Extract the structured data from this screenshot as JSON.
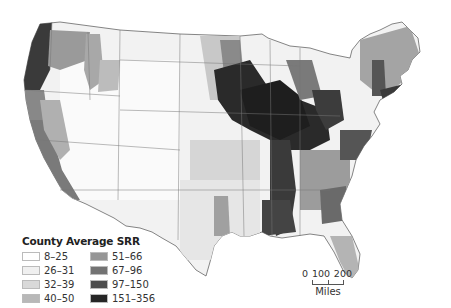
{
  "legend": {
    "title": "County Average SRR",
    "items": [
      {
        "label": "8–25",
        "color": "#ffffff"
      },
      {
        "label": "26–31",
        "color": "#f0f0f0"
      },
      {
        "label": "32–39",
        "color": "#d9d9d9"
      },
      {
        "label": "40–50",
        "color": "#b8b8b8"
      },
      {
        "label": "51–66",
        "color": "#969696"
      },
      {
        "label": "67–96",
        "color": "#737373"
      },
      {
        "label": "97–150",
        "color": "#4d4d4d"
      },
      {
        "label": "151–356",
        "color": "#262626"
      }
    ]
  },
  "scalebar": {
    "ticks": [
      "0",
      "100",
      "200"
    ],
    "unit": "Miles"
  },
  "map": {
    "region": "Contiguous United States",
    "unit": "County"
  }
}
